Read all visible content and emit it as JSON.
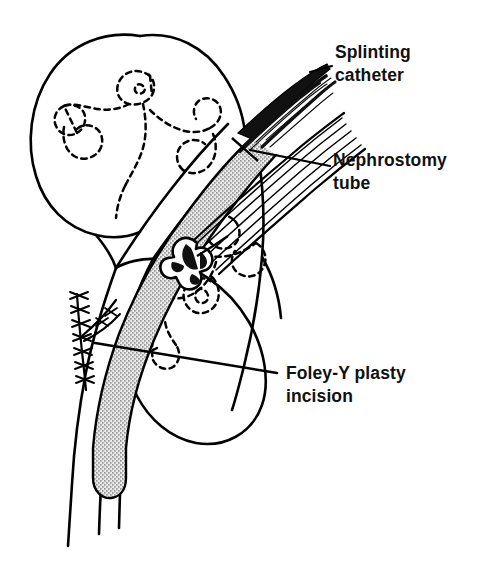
{
  "figure": {
    "type": "medical-line-illustration",
    "background_color": "#ffffff",
    "ink_color": "#000000",
    "stipple_color": "#000000",
    "width": 485,
    "height": 567
  },
  "labels": [
    {
      "id": "splinting-catheter",
      "line1": "Splinting",
      "line2": "catheter",
      "x": 335,
      "y": 58,
      "leader_from": [
        330,
        62
      ],
      "leader_to": [
        300,
        72
      ]
    },
    {
      "id": "nephrostomy-tube",
      "line1": "Nephrostomy",
      "line2": "tube",
      "x": 333,
      "y": 166,
      "leader_from": [
        328,
        168
      ],
      "leader_to": [
        255,
        152
      ]
    },
    {
      "id": "foley-y-plasty-incision",
      "line1": "Foley-Y plasty",
      "line2": "incision",
      "x": 281,
      "y": 378,
      "leader_from": [
        275,
        373
      ],
      "leader_to": [
        95,
        343
      ]
    }
  ],
  "structures": [
    {
      "id": "kidney-outline",
      "name": "Kidney parenchyma outline",
      "stroke": "#000000",
      "style": "solid"
    },
    {
      "id": "calyceal-system",
      "name": "Renal collecting system (calyces)",
      "stroke": "#000000",
      "style": "dashed"
    },
    {
      "id": "ureter",
      "name": "Ureter",
      "stroke": "#000000",
      "style": "solid"
    },
    {
      "id": "splinting-catheter-shaft",
      "name": "Splinting catheter within ureter",
      "fill": "stipple"
    },
    {
      "id": "splinting-catheter-exit",
      "name": "Splinting catheter exiting flank",
      "fill": "#000000"
    },
    {
      "id": "nephrostomy-tube-shaft",
      "name": "Nephrostomy tube",
      "stroke": "#000000",
      "style": "multi-line"
    },
    {
      "id": "nephrostomy-tube-tip",
      "name": "Nephrostomy tube malecot tip",
      "fill": "#000000"
    },
    {
      "id": "suture-line",
      "name": "Suture line of Foley-Y plasty incision",
      "stroke": "#000000",
      "style": "stitches"
    }
  ]
}
